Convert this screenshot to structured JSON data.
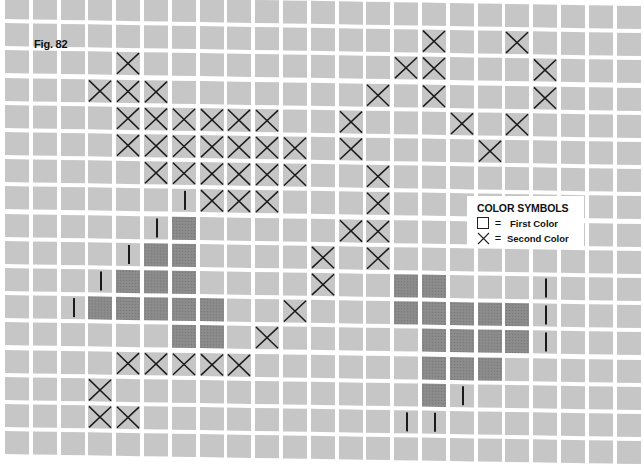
{
  "figure": {
    "label": "Fig. 82",
    "grid": {
      "columns": 23,
      "rows": 17,
      "origin_x": 3,
      "origin_y": 0,
      "pitch_x": 27.8,
      "pitch_y": 27.2
    },
    "colors": {
      "background": "#ffffff",
      "cell_first_color": "#c6c6c6",
      "cell_shaded": "#8c8c8c",
      "mark": "#1a1a1a"
    },
    "x_marks": [
      [
        1,
        15
      ],
      [
        1,
        18
      ],
      [
        2,
        4
      ],
      [
        2,
        14
      ],
      [
        2,
        15
      ],
      [
        2,
        19
      ],
      [
        3,
        3
      ],
      [
        3,
        4
      ],
      [
        3,
        5
      ],
      [
        3,
        13
      ],
      [
        3,
        15
      ],
      [
        3,
        19
      ],
      [
        4,
        4
      ],
      [
        4,
        5
      ],
      [
        4,
        6
      ],
      [
        4,
        7
      ],
      [
        4,
        8
      ],
      [
        4,
        9
      ],
      [
        4,
        12
      ],
      [
        4,
        16
      ],
      [
        4,
        18
      ],
      [
        5,
        4
      ],
      [
        5,
        5
      ],
      [
        5,
        6
      ],
      [
        5,
        7
      ],
      [
        5,
        8
      ],
      [
        5,
        9
      ],
      [
        5,
        10
      ],
      [
        5,
        12
      ],
      [
        5,
        17
      ],
      [
        6,
        5
      ],
      [
        6,
        6
      ],
      [
        6,
        7
      ],
      [
        6,
        8
      ],
      [
        6,
        9
      ],
      [
        6,
        10
      ],
      [
        6,
        13
      ],
      [
        7,
        7
      ],
      [
        7,
        8
      ],
      [
        7,
        9
      ],
      [
        7,
        13
      ],
      [
        8,
        12
      ],
      [
        8,
        13
      ],
      [
        9,
        11
      ],
      [
        9,
        13
      ],
      [
        10,
        11
      ],
      [
        11,
        10
      ],
      [
        12,
        9
      ],
      [
        13,
        4
      ],
      [
        13,
        5
      ],
      [
        13,
        6
      ],
      [
        13,
        7
      ],
      [
        13,
        8
      ],
      [
        14,
        3
      ],
      [
        15,
        3
      ],
      [
        15,
        4
      ]
    ],
    "shaded_cells": [
      [
        8,
        6
      ],
      [
        9,
        5
      ],
      [
        9,
        6
      ],
      [
        10,
        4
      ],
      [
        10,
        5
      ],
      [
        10,
        6
      ],
      [
        10,
        14
      ],
      [
        10,
        15
      ],
      [
        11,
        3
      ],
      [
        11,
        4
      ],
      [
        11,
        5
      ],
      [
        11,
        6
      ],
      [
        11,
        7
      ],
      [
        11,
        14
      ],
      [
        11,
        15
      ],
      [
        11,
        16
      ],
      [
        11,
        17
      ],
      [
        11,
        18
      ],
      [
        12,
        6
      ],
      [
        12,
        7
      ],
      [
        12,
        15
      ],
      [
        12,
        16
      ],
      [
        12,
        17
      ],
      [
        12,
        18
      ],
      [
        13,
        15
      ],
      [
        13,
        16
      ],
      [
        13,
        17
      ],
      [
        14,
        15
      ]
    ],
    "vertical_marks": [
      [
        7,
        6
      ],
      [
        8,
        5
      ],
      [
        9,
        4
      ],
      [
        10,
        3
      ],
      [
        11,
        2
      ],
      [
        10,
        19
      ],
      [
        11,
        19
      ],
      [
        12,
        19
      ],
      [
        14,
        16
      ],
      [
        15,
        14
      ],
      [
        15,
        15
      ]
    ]
  },
  "legend": {
    "title": "COLOR SYMBOLS",
    "items": [
      {
        "symbol": "empty-square",
        "equals": "=",
        "label": "First Color"
      },
      {
        "symbol": "x-cross",
        "equals": "=",
        "label": "Second Color"
      }
    ]
  }
}
